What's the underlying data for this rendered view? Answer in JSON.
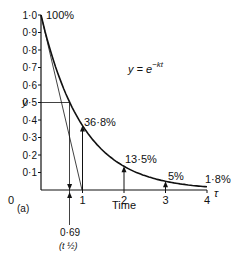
{
  "chart_data": {
    "type": "line",
    "title": "",
    "equation": "y = e",
    "equation_exp": "−kt",
    "xlabel": "Time",
    "x_unit": "τ",
    "ylabel": "y",
    "panel_label": "(a)",
    "xlim": [
      0,
      4
    ],
    "ylim": [
      0,
      1.0
    ],
    "x_ticks": [
      "0",
      "1",
      "2",
      "3",
      "4"
    ],
    "y_ticks": [
      "0·1",
      "0·2",
      "0·3",
      "0·4",
      "0·5",
      "0·6",
      "0·7",
      "0·8",
      "0·9",
      "1·0"
    ],
    "series": [
      {
        "name": "y = e^-kt",
        "x": [
          0,
          0.5,
          0.69,
          1,
          1.5,
          2,
          2.5,
          3,
          3.5,
          4
        ],
        "values": [
          1.0,
          0.607,
          0.5,
          0.368,
          0.223,
          0.135,
          0.082,
          0.05,
          0.03,
          0.018
        ]
      }
    ],
    "annotations": [
      {
        "text": "100%",
        "x": 0,
        "y": 1.0
      },
      {
        "text": "36·8%",
        "x": 1,
        "y": 0.368
      },
      {
        "text": "13·5%",
        "x": 2,
        "y": 0.135
      },
      {
        "text": "5%",
        "x": 3,
        "y": 0.05
      },
      {
        "text": "1·8%",
        "x": 4,
        "y": 0.018
      }
    ],
    "half_life": {
      "value": "0·69",
      "label": "t ½",
      "y": 0.5
    },
    "tangent": {
      "from": [
        0,
        1.0
      ],
      "to": [
        1,
        0
      ]
    }
  }
}
